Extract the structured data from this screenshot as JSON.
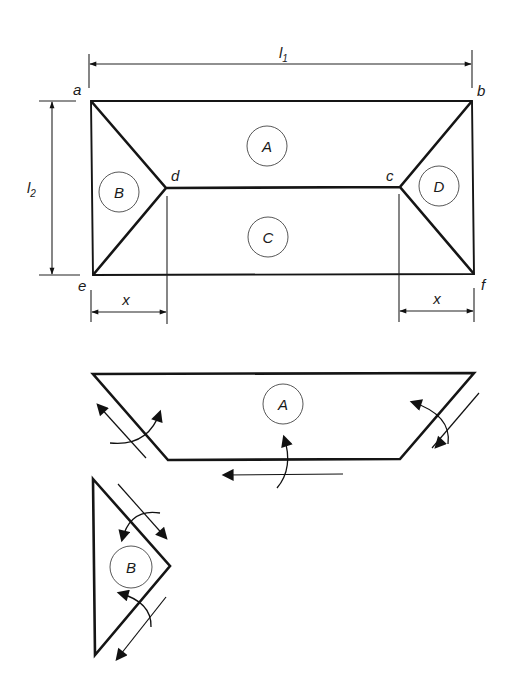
{
  "figure": {
    "plan": {
      "corner_labels": {
        "a": "a",
        "b": "b",
        "c": "c",
        "d": "d",
        "e": "e",
        "f": "f"
      },
      "region_labels": {
        "A": "A",
        "B": "B",
        "C": "C",
        "D": "D"
      },
      "dimensions": {
        "l1": {
          "main": "l",
          "sub": "1"
        },
        "l2": {
          "main": "l",
          "sub": "2"
        },
        "x_left": "x",
        "x_right": "x"
      }
    },
    "panel_A": {
      "label": "A"
    },
    "panel_B": {
      "label": "B"
    }
  }
}
